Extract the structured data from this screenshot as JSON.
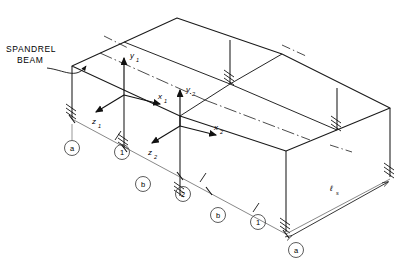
{
  "figure": {
    "type": "isometric-structural-frame-diagram"
  },
  "annotations": {
    "spandrel_label_line1": "SPANDREL",
    "spandrel_label_line2": "BEAM"
  },
  "axes": [
    {
      "id": "system-1",
      "y_label": "y",
      "y_sub": "1",
      "x_label": "x",
      "x_sub": "1",
      "z_label": "z",
      "z_sub": "1"
    },
    {
      "id": "system-2",
      "y_label": "y",
      "y_sub": "2",
      "x_label": "x",
      "x_sub": "2",
      "z_label": "z",
      "z_sub": "2"
    }
  ],
  "grid_markers": [
    {
      "label": "a",
      "position": "front-left-near"
    },
    {
      "label": "1",
      "position": "front-left-mid"
    },
    {
      "label": "b",
      "position": "front-left-far"
    },
    {
      "label": "2",
      "position": "front-center"
    },
    {
      "label": "b",
      "position": "front-right-mid"
    },
    {
      "label": "1",
      "position": "front-right-far"
    },
    {
      "label": "a",
      "position": "front-right-corner"
    }
  ],
  "centerlines": [
    {
      "label": "℄",
      "position": "top-left"
    },
    {
      "label": "℄",
      "position": "top-right"
    },
    {
      "label": "℄",
      "position": "mid-right"
    }
  ],
  "dimensions": [
    {
      "label": "ℓ",
      "sub": "s",
      "position": "bottom-right"
    }
  ],
  "colors": {
    "line": "#1a1a1a",
    "thin_line": "#555555",
    "background": "#ffffff"
  }
}
